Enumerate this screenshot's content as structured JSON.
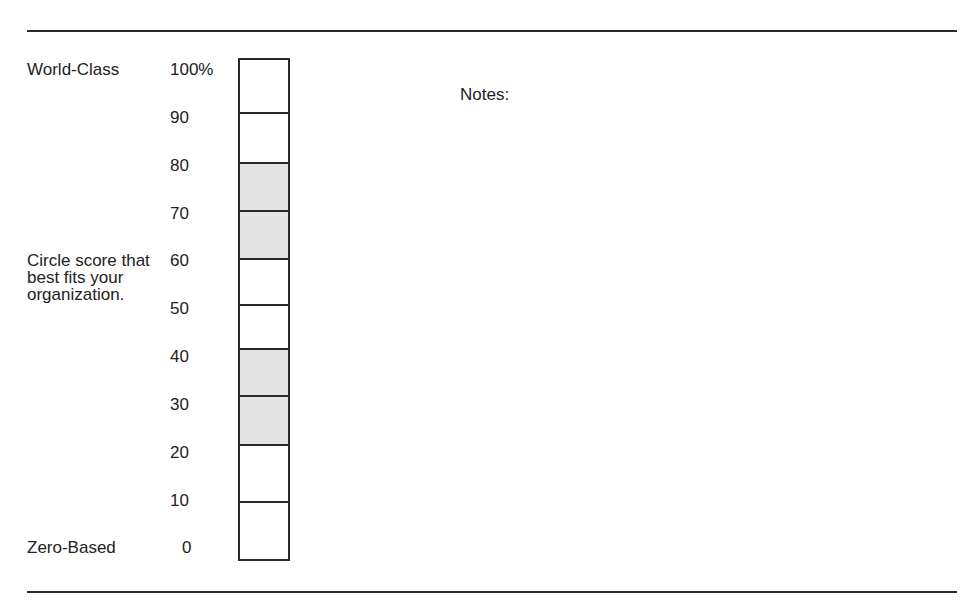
{
  "labels": {
    "top": "World-Class",
    "middle": "Circle score that best fits your organization.",
    "bottom": "Zero-Based"
  },
  "ticks": [
    "100%",
    "90",
    "80",
    "70",
    "60",
    "50",
    "40",
    "30",
    "20",
    "10",
    "0"
  ],
  "notes_label": "Notes:",
  "scale": {
    "segments": [
      {
        "from": 90,
        "to": 100,
        "shaded": false
      },
      {
        "from": 80,
        "to": 90,
        "shaded": false
      },
      {
        "from": 70,
        "to": 80,
        "shaded": true
      },
      {
        "from": 60,
        "to": 70,
        "shaded": true
      },
      {
        "from": 50,
        "to": 60,
        "shaded": false
      },
      {
        "from": 40,
        "to": 50,
        "shaded": false
      },
      {
        "from": 30,
        "to": 40,
        "shaded": true
      },
      {
        "from": 20,
        "to": 30,
        "shaded": true
      },
      {
        "from": 10,
        "to": 20,
        "shaded": false
      },
      {
        "from": 0,
        "to": 10,
        "shaded": false
      }
    ],
    "shade_color": "#e4e4e4",
    "border_color": "#2a2a2a"
  }
}
